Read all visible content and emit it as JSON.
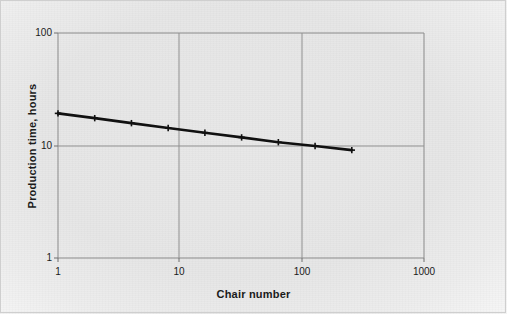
{
  "figure": {
    "background_color": "#e8e8e8",
    "plot_line_color": "#111111",
    "grid_color": "#8c8c8c"
  },
  "chart_data": {
    "type": "line",
    "title": "",
    "subtitle": "",
    "xlabel": "Chair number",
    "ylabel": "Production time, hours",
    "xscale": "log",
    "yscale": "log",
    "xlim": [
      1,
      1000
    ],
    "ylim": [
      1,
      100
    ],
    "grid": true,
    "legend": null,
    "x_tick_labels": [
      "1",
      "10",
      "100",
      "1000"
    ],
    "x_ticks": [
      1,
      10,
      100,
      1000
    ],
    "y_tick_labels": [
      "1",
      "10",
      "100"
    ],
    "y_ticks": [
      1,
      10,
      100
    ],
    "marker": "plus",
    "series": [
      {
        "name": "Production time",
        "x": [
          1,
          2,
          4,
          8,
          16,
          32,
          64,
          128,
          256
        ],
        "values": [
          19.3,
          17.5,
          15.8,
          14.3,
          13.0,
          11.8,
          10.7,
          9.9,
          9.1
        ]
      }
    ],
    "annotations": []
  },
  "labels": {
    "x_axis_title": "Chair number",
    "y_axis_title": "Production time, hours",
    "y_100": "100",
    "y_10": "10",
    "y_1": "1",
    "x_1": "1",
    "x_10": "10",
    "x_100": "100",
    "x_1000": "1000"
  }
}
